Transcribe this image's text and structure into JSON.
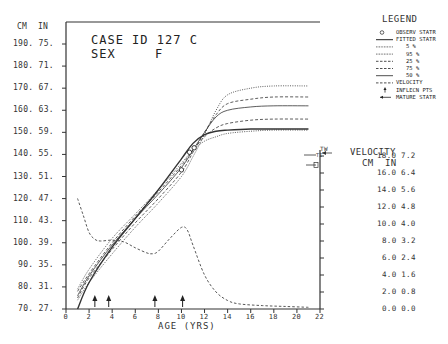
{
  "header": {
    "case_label": "CASE ID 127 C",
    "sex_label": "SEX",
    "sex_value": "F"
  },
  "axes": {
    "left_unit_cm": "CM",
    "left_unit_in": "IN",
    "right_title": "VELOCITY",
    "right_unit_cm": "CM",
    "right_unit_in": "IN",
    "x_label": "AGE (YRS)"
  },
  "legend": {
    "title": "LEGEND",
    "items": [
      {
        "symbol": "circle",
        "label": "OBSERV STATR"
      },
      {
        "symbol": "solid",
        "label": "FITTED STATR"
      },
      {
        "symbol": "dotted",
        "label": "5 %"
      },
      {
        "symbol": "dotted",
        "label": "95 %"
      },
      {
        "symbol": "dashed",
        "label": "25 %"
      },
      {
        "symbol": "dashed",
        "label": "75 %"
      },
      {
        "symbol": "solid-thin",
        "label": "50 %"
      },
      {
        "symbol": "dashed",
        "label": "VELOCITY"
      },
      {
        "symbol": "arrow-up",
        "label": "INFLECN PTS"
      },
      {
        "symbol": "arrow-left",
        "label": "MATURE STATR"
      }
    ]
  },
  "markers": {
    "tw": "TW",
    "ti": "TI"
  },
  "chart_data": {
    "type": "line",
    "xlabel": "AGE (YRS)",
    "ylabel": "Stature CM / IN",
    "y2label": "VELOCITY CM / IN",
    "xlim": [
      0,
      22
    ],
    "ylim": [
      70,
      190
    ],
    "y2lim": [
      0,
      18
    ],
    "x_ticks": [
      0,
      2,
      4,
      6,
      8,
      10,
      12,
      14,
      16,
      18,
      20,
      22
    ],
    "y_ticks": [
      {
        "cm": "190.",
        "in": "75."
      },
      {
        "cm": "180.",
        "in": "71."
      },
      {
        "cm": "170.",
        "in": "67."
      },
      {
        "cm": "160.",
        "in": "63."
      },
      {
        "cm": "150.",
        "in": "59."
      },
      {
        "cm": "140.",
        "in": "55."
      },
      {
        "cm": "130.",
        "in": "51."
      },
      {
        "cm": "120.",
        "in": "47."
      },
      {
        "cm": "110.",
        "in": "43."
      },
      {
        "cm": "100.",
        "in": "39."
      },
      {
        "cm": "90.",
        "in": "35."
      },
      {
        "cm": "80.",
        "in": "31."
      },
      {
        "cm": "70.",
        "in": "27."
      }
    ],
    "y2_ticks": [
      {
        "cm": "18.0",
        "in": "7.2"
      },
      {
        "cm": "16.0",
        "in": "6.4"
      },
      {
        "cm": "14.0",
        "in": "5.6"
      },
      {
        "cm": "12.0",
        "in": "4.8"
      },
      {
        "cm": "10.0",
        "in": "4.0"
      },
      {
        "cm": "8.0",
        "in": "3.2"
      },
      {
        "cm": "6.0",
        "in": "2.4"
      },
      {
        "cm": "4.0",
        "in": "1.6"
      },
      {
        "cm": "2.0",
        "in": "0.8"
      },
      {
        "cm": "0.0",
        "in": "0.0"
      }
    ],
    "x": [
      1,
      2,
      4,
      6,
      8,
      10,
      11,
      12,
      13,
      14,
      16,
      18,
      21
    ],
    "series": [
      {
        "name": "5 %",
        "style": "dotted",
        "values": [
          79,
          88,
          102,
          113,
          124,
          136,
          142,
          146,
          148,
          149.5,
          150.5,
          151,
          151
        ]
      },
      {
        "name": "25 %",
        "style": "dashed",
        "values": [
          78,
          86,
          100,
          112,
          123,
          135,
          142,
          148,
          152,
          154,
          155.5,
          156,
          156
        ]
      },
      {
        "name": "50 %",
        "style": "solid",
        "values": [
          76,
          85,
          99,
          111,
          122,
          134,
          142,
          150,
          157,
          160,
          161.5,
          162,
          162
        ]
      },
      {
        "name": "75 %",
        "style": "dashed",
        "values": [
          75,
          84,
          97,
          109,
          120,
          132,
          141,
          150,
          158,
          163,
          165,
          166,
          166
        ]
      },
      {
        "name": "95 %",
        "style": "dotted",
        "values": [
          74,
          82,
          95,
          107,
          118,
          130,
          139,
          149,
          160,
          167,
          170,
          171,
          171
        ]
      },
      {
        "name": "FITTED STATR",
        "style": "solid-bold",
        "values": [
          70,
          82,
          98,
          111,
          124,
          138,
          145,
          149,
          150.5,
          151,
          151.5,
          151.5,
          151.5
        ]
      }
    ],
    "observed": [
      {
        "age": 10.0,
        "cm": 133
      },
      {
        "age": 10.7,
        "cm": 141
      },
      {
        "age": 11.1,
        "cm": 143
      }
    ],
    "velocity": {
      "name": "VELOCITY",
      "style": "dashed",
      "x": [
        1.0,
        1.5,
        2.0,
        2.5,
        3.0,
        4.0,
        5.0,
        6.0,
        7.0,
        7.5,
        8.0,
        9.0,
        10.0,
        10.5,
        11.0,
        12.0,
        13.0,
        14.0,
        15.0,
        17.0,
        19.0,
        21.0
      ],
      "values": [
        13.0,
        11.0,
        9.0,
        8.2,
        8.0,
        8.1,
        7.9,
        7.2,
        6.6,
        6.5,
        6.8,
        8.3,
        9.6,
        9.3,
        7.5,
        4.0,
        2.0,
        1.0,
        0.6,
        0.4,
        0.3,
        0.2
      ]
    },
    "inflection_points": [
      2.5,
      3.7,
      7.7,
      10.1
    ],
    "mature_stature_cm": 151.5,
    "grid": false,
    "legend_position": "right-top"
  }
}
